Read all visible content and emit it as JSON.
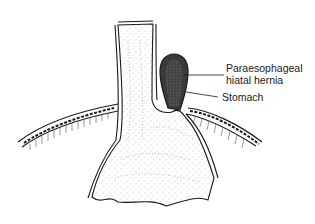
{
  "diagram": {
    "labels": {
      "hernia_line1": "Paraesophageal",
      "hernia_line2": "hiatal hernia",
      "stomach": "Stomach"
    },
    "colors": {
      "outline": "#1a1a1a",
      "hernia_fill": "#3a3a3a",
      "hernia_inner": "#6a6a6a",
      "background": "#ffffff"
    }
  }
}
